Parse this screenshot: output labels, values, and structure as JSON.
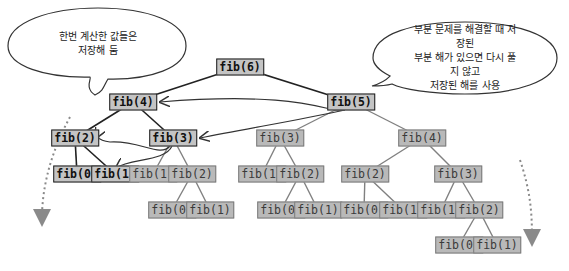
{
  "colors": {
    "node_fill": "#c4c4c4",
    "primary_edge": "#222222",
    "memo_edge": "#808080",
    "dashed_arrow": "#8a8a8a"
  },
  "bubbles": {
    "left": {
      "text": "한번 계산한 값들은\n저장해 둠"
    },
    "right": {
      "text": "부분 문제를 해결할 때 저장된\n부분 해가 있으면 다시 풀지 않고\n저장된 해를 사용"
    }
  },
  "nodes": [
    {
      "id": "n6",
      "label": "fib(6)",
      "x": 240,
      "y": 67,
      "style": "primary"
    },
    {
      "id": "n4",
      "label": "fib(4)",
      "x": 133,
      "y": 102,
      "style": "primary"
    },
    {
      "id": "n5",
      "label": "fib(5)",
      "x": 351,
      "y": 102,
      "style": "primary"
    },
    {
      "id": "n2a",
      "label": "fib(2)",
      "x": 75,
      "y": 138,
      "style": "primary"
    },
    {
      "id": "n3a",
      "label": "fib(3)",
      "x": 173,
      "y": 138,
      "style": "primary"
    },
    {
      "id": "n0a",
      "label": "fib(0)",
      "x": 77,
      "y": 174,
      "style": "primary"
    },
    {
      "id": "n1a",
      "label": "fib(1)",
      "x": 115,
      "y": 174,
      "style": "primary"
    },
    {
      "id": "n1b",
      "label": "fib(1)",
      "x": 153,
      "y": 174,
      "style": "memo"
    },
    {
      "id": "n2b",
      "label": "fib(2)",
      "x": 192,
      "y": 174,
      "style": "memo"
    },
    {
      "id": "n0b",
      "label": "fib(0)",
      "x": 172,
      "y": 210,
      "style": "memo"
    },
    {
      "id": "n1c",
      "label": "fib(1)",
      "x": 210,
      "y": 210,
      "style": "memo"
    },
    {
      "id": "n3b",
      "label": "fib(3)",
      "x": 280,
      "y": 138,
      "style": "memo"
    },
    {
      "id": "n1d",
      "label": "fib(1)",
      "x": 262,
      "y": 174,
      "style": "memo"
    },
    {
      "id": "n2c",
      "label": "fib(2)",
      "x": 300,
      "y": 174,
      "style": "memo"
    },
    {
      "id": "n0c",
      "label": "fib(0)",
      "x": 281,
      "y": 210,
      "style": "memo"
    },
    {
      "id": "n1e",
      "label": "fib(1)",
      "x": 318,
      "y": 210,
      "style": "memo"
    },
    {
      "id": "n4b",
      "label": "fib(4)",
      "x": 422,
      "y": 138,
      "style": "memo"
    },
    {
      "id": "n2d",
      "label": "fib(2)",
      "x": 365,
      "y": 174,
      "style": "memo"
    },
    {
      "id": "n0d",
      "label": "fib(0)",
      "x": 364,
      "y": 210,
      "style": "memo"
    },
    {
      "id": "n1f",
      "label": "fib(1)",
      "x": 403,
      "y": 210,
      "style": "memo"
    },
    {
      "id": "n3c",
      "label": "fib(3)",
      "x": 458,
      "y": 174,
      "style": "memo"
    },
    {
      "id": "n1g",
      "label": "fib(1)",
      "x": 441,
      "y": 210,
      "style": "memo"
    },
    {
      "id": "n2e",
      "label": "fib(2)",
      "x": 479,
      "y": 210,
      "style": "memo"
    },
    {
      "id": "n0e",
      "label": "fib(0)",
      "x": 459,
      "y": 245,
      "style": "memo"
    },
    {
      "id": "n1h",
      "label": "fib(1)",
      "x": 497,
      "y": 245,
      "style": "memo"
    }
  ]
}
